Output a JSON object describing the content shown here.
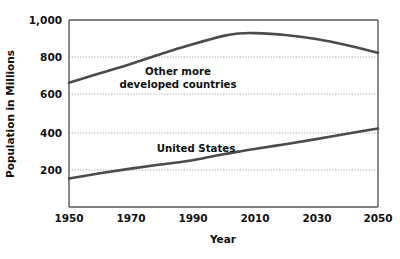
{
  "chart_data": {
    "type": "line",
    "title": "",
    "xlabel": "Year",
    "ylabel": "Population in Millions",
    "xlim": [
      1950,
      2050
    ],
    "ylim": [
      0,
      1000
    ],
    "grid": true,
    "legend_position": "inline-annotations",
    "xticks": [
      "1950",
      "1970",
      "1990",
      "2010",
      "2030",
      "2050"
    ],
    "xtick_values": [
      1950,
      1970,
      1990,
      2010,
      2030,
      2050
    ],
    "yticks": [
      "200",
      "400",
      "600",
      "800",
      "1,000"
    ],
    "ytick_values": [
      200,
      400,
      600,
      800,
      1000
    ],
    "x": [
      1950,
      1960,
      1970,
      1980,
      1990,
      2000,
      2005,
      2010,
      2020,
      2030,
      2040,
      2050
    ],
    "series": [
      {
        "name": "Other more developed countries",
        "label_line_1": "Other more",
        "label_line_2": "developed countries",
        "color": "#4b4b4d",
        "values": [
          665,
          715,
          765,
          820,
          870,
          915,
          928,
          930,
          920,
          898,
          865,
          825
        ]
      },
      {
        "name": "United States",
        "label_line_1": "United States",
        "label_line_2": "",
        "color": "#4b4b4d",
        "values": [
          152,
          180,
          205,
          228,
          250,
          282,
          296,
          310,
          336,
          363,
          392,
          420
        ]
      }
    ],
    "annotations": [
      {
        "text": "Other more",
        "x": 1995,
        "y": 755
      },
      {
        "text": "developed countries",
        "x": 1995,
        "y": 700
      },
      {
        "text": "United States",
        "x": 1998,
        "y": 428
      }
    ]
  }
}
